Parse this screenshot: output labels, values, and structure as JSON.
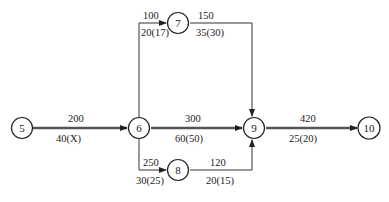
{
  "diagram": {
    "type": "activity-on-arrow network",
    "nodes": [
      {
        "id": "5",
        "label": "5"
      },
      {
        "id": "6",
        "label": "6"
      },
      {
        "id": "7",
        "label": "7"
      },
      {
        "id": "8",
        "label": "8"
      },
      {
        "id": "9",
        "label": "9"
      },
      {
        "id": "10",
        "label": "10"
      }
    ],
    "edges": [
      {
        "from": "5",
        "to": "6",
        "top": "200",
        "bottom": "40(X)",
        "critical": true
      },
      {
        "from": "6",
        "to": "7",
        "top": "100",
        "bottom": "20(17)",
        "critical": false
      },
      {
        "from": "7",
        "to": "9",
        "top": "150",
        "bottom": "35(30)",
        "critical": false
      },
      {
        "from": "6",
        "to": "9",
        "top": "300",
        "bottom": "60(50)",
        "critical": true
      },
      {
        "from": "6",
        "to": "8",
        "top": "250",
        "bottom": "30(25)",
        "critical": false
      },
      {
        "from": "8",
        "to": "9",
        "top": "120",
        "bottom": "20(15)",
        "critical": false
      },
      {
        "from": "9",
        "to": "10",
        "top": "420",
        "bottom": "25(20)",
        "critical": true
      }
    ]
  }
}
